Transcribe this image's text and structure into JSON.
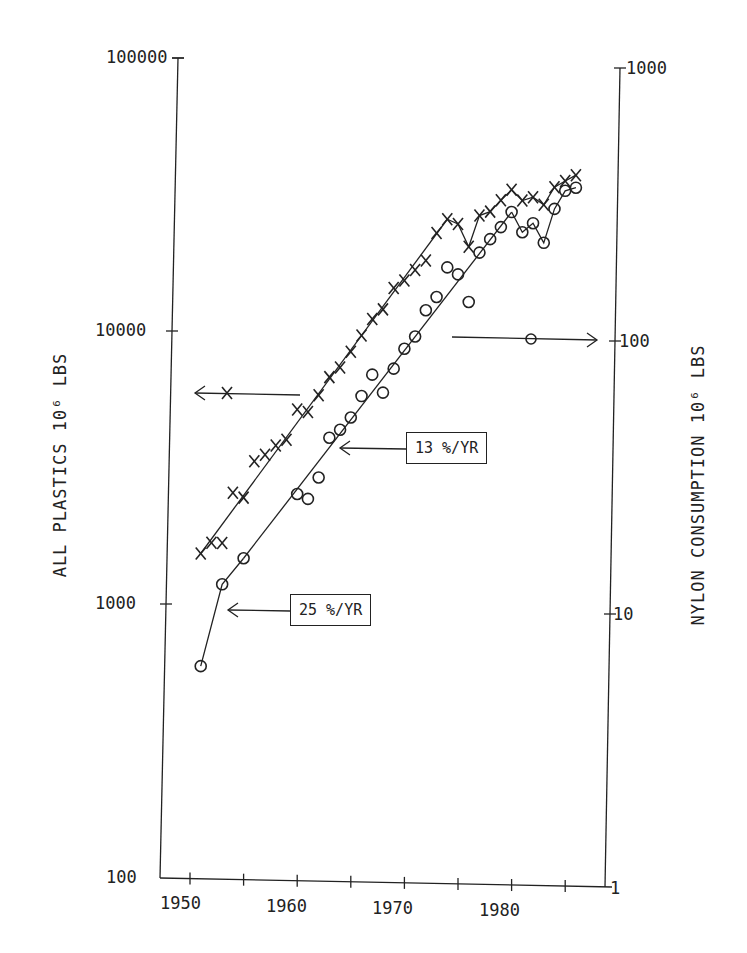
{
  "chart_data": {
    "type": "scatter",
    "title": "",
    "xlabel": "",
    "ylabel": "ALL PLASTICS 10^6 LBS",
    "ylabel_right": "NYLON CONSUMPTION 10^6 LBS",
    "x_ticks": [
      "1950",
      "1960",
      "1970",
      "1980"
    ],
    "y_ticks_left": [
      "100",
      "1000",
      "10000",
      "100000"
    ],
    "y_ticks_right": [
      "1",
      "10",
      "100",
      "1000"
    ],
    "xlim": [
      1947,
      1987
    ],
    "ylim_left": [
      100,
      100000
    ],
    "ylim_right": [
      1,
      1000
    ],
    "yscale": "log",
    "grid": false,
    "series": [
      {
        "name": "All plastics (X)",
        "marker": "x",
        "axis": "left",
        "x": [
          1951,
          1952,
          1953,
          1954,
          1955,
          1956,
          1957,
          1958,
          1959,
          1960,
          1961,
          1962,
          1963,
          1964,
          1965,
          1966,
          1967,
          1968,
          1969,
          1970,
          1971,
          1972,
          1973,
          1974,
          1975,
          1976,
          1977,
          1978,
          1979,
          1980,
          1981,
          1982,
          1983,
          1984,
          1985,
          1986
        ],
        "y": [
          1550,
          1700,
          1700,
          2600,
          2500,
          3400,
          3600,
          3900,
          4100,
          5300,
          5200,
          6000,
          7000,
          7600,
          8700,
          10000,
          11500,
          12500,
          15000,
          16000,
          17500,
          19000,
          24000,
          27000,
          26000,
          21500,
          28000,
          29000,
          32000,
          35000,
          32000,
          33000,
          31000,
          36000,
          38000,
          40000
        ]
      },
      {
        "name": "Nylon consumption (O)",
        "marker": "o",
        "axis": "right",
        "x": [
          1951,
          1953,
          1955,
          1960,
          1961,
          1962,
          1963,
          1964,
          1965,
          1966,
          1967,
          1968,
          1969,
          1970,
          1971,
          1972,
          1973,
          1974,
          1975,
          1976,
          1977,
          1978,
          1979,
          1980,
          1981,
          1982,
          1983,
          1984,
          1985,
          1986
        ],
        "y": [
          6,
          12,
          15,
          26,
          25,
          30,
          42,
          45,
          50,
          60,
          72,
          62,
          76,
          90,
          100,
          125,
          140,
          180,
          170,
          135,
          205,
          230,
          255,
          290,
          245,
          265,
          225,
          300,
          350,
          360
        ]
      }
    ],
    "trend_lines": [
      {
        "label": "25 %/YR",
        "series": "nylon",
        "from": 1951,
        "to": 1955
      },
      {
        "label": "13 %/YR",
        "series": "nylon",
        "from": 1955,
        "to": 1981
      },
      {
        "label": "",
        "series": "plastics",
        "from": 1951,
        "to": 1974
      }
    ],
    "annotations": [
      {
        "text": "25 %/YR",
        "type": "boxed label with arrow pointing left to nylon trend line"
      },
      {
        "text": "13 %/YR",
        "type": "boxed label with arrow pointing left to nylon trend line"
      },
      {
        "text": "X",
        "type": "arrow pointing left → left axis (all plastics)"
      },
      {
        "text": "O",
        "type": "arrow pointing right → right axis (nylon)"
      }
    ]
  },
  "labels": {
    "y_left_title": "ALL PLASTICS 10⁶ LBS",
    "y_right_title": "NYLON CONSUMPTION 10⁶ LBS",
    "box_25": "25 %/YR",
    "box_13": "13 %/YR",
    "ytick_left_100000": "100000",
    "ytick_left_10000": "10000",
    "ytick_left_1000": "1000",
    "ytick_left_100": "100",
    "ytick_right_1000": "1000",
    "ytick_right_100": "100",
    "ytick_right_10": "10",
    "ytick_right_1": "1",
    "xtick_1950": "1950",
    "xtick_1960": "1960",
    "xtick_1970": "1970",
    "xtick_1980": "1980"
  }
}
